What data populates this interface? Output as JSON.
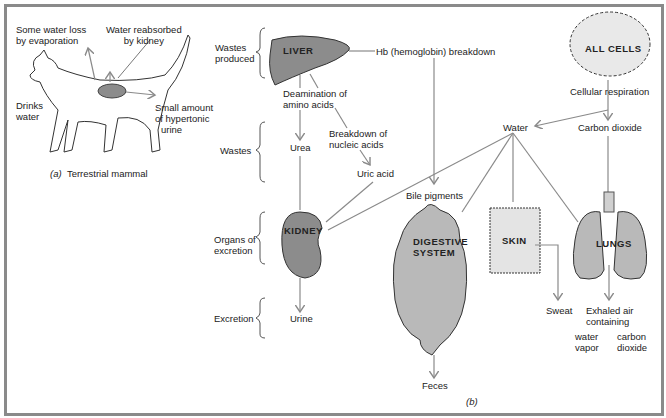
{
  "panel_a": {
    "caption_letter": "(a)",
    "caption_text": "Terrestrial mammal",
    "labels": {
      "evaporation": [
        "Some water loss",
        "by evaporation"
      ],
      "reabsorbed": [
        "Water reabsorbed",
        "by kidney"
      ],
      "drinks": [
        "Drinks",
        "water"
      ],
      "urine": [
        "Small amount",
        "of hypertonic",
        "urine"
      ]
    }
  },
  "panel_b": {
    "caption": "(b)",
    "brackets": {
      "wastes_produced": [
        "Wastes",
        "produced"
      ],
      "wastes": "Wastes",
      "organs": [
        "Organs of",
        "excretion"
      ],
      "excretion": "Excretion"
    },
    "organs": {
      "liver": "LIVER",
      "kidney": "KIDNEY",
      "digestive": [
        "DIGESTIVE",
        "SYSTEM"
      ],
      "skin": "SKIN",
      "lungs": "LUNGS",
      "cells": "ALL CELLS"
    },
    "labels": {
      "hb": "Hb (hemoglobin) breakdown",
      "deamination": [
        "Deamination of",
        "amino acids"
      ],
      "urea": "Urea",
      "nucleic": [
        "Breakdown of",
        "nucleic acids"
      ],
      "uric": "Uric acid",
      "bile": "Bile pigments",
      "cellular": "Cellular respiration",
      "water": "Water",
      "co2": "Carbon dioxide",
      "urine": "Urine",
      "feces": "Feces",
      "sweat": "Sweat",
      "exhaled": [
        "Exhaled air",
        "containing"
      ],
      "water_vapor": [
        "water",
        "vapor"
      ],
      "carbon_dioxide": [
        "carbon",
        "dioxide"
      ]
    }
  },
  "colors": {
    "organ_fill": "#8c8c8c",
    "organ_light": "#b9b9b9",
    "arrow": "#8a8a8a",
    "frame": "#8a8a8a"
  }
}
